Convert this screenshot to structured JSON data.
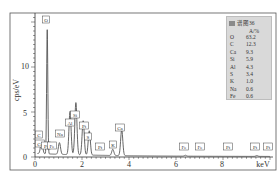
{
  "chart_data": {
    "type": "line",
    "title": "",
    "xlabel": "keV",
    "ylabel": "cps/eV",
    "xlim": [
      0,
      10
    ],
    "ylim": [
      0,
      14
    ],
    "x_ticks": [
      0,
      2,
      4,
      6,
      8
    ],
    "y_ticks": [
      0,
      5,
      10
    ],
    "grid": false,
    "legend_position": "upper right",
    "series": [
      {
        "name": "谱图36",
        "peaks": [
          {
            "element": "C",
            "energy_keV": 0.28,
            "cps_per_eV": 1.5
          },
          {
            "element": "O",
            "energy_keV": 0.52,
            "cps_per_eV": 13.8
          },
          {
            "element": "Na",
            "energy_keV": 1.04,
            "cps_per_eV": 1.3
          },
          {
            "element": "Al",
            "energy_keV": 1.49,
            "cps_per_eV": 4.8
          },
          {
            "element": "Si",
            "energy_keV": 1.74,
            "cps_per_eV": 5.8
          },
          {
            "element": "Pt",
            "energy_keV": 2.05,
            "cps_per_eV": 3.8
          },
          {
            "element": "S",
            "energy_keV": 2.31,
            "cps_per_eV": 2.7
          },
          {
            "element": "K",
            "energy_keV": 3.31,
            "cps_per_eV": 0.7
          },
          {
            "element": "Ca",
            "energy_keV": 3.69,
            "cps_per_eV": 2.9
          },
          {
            "element": "Fe",
            "energy_keV": 6.4,
            "cps_per_eV": 0.1
          },
          {
            "element": "Pt",
            "energy_keV": 9.44,
            "cps_per_eV": 0.1
          }
        ]
      }
    ],
    "peak_labels": [
      {
        "label": "O",
        "x_keV": 0.52
      },
      {
        "label": "C",
        "x_keV": 0.28
      },
      {
        "label": "Ca",
        "x_keV": 0.34
      },
      {
        "label": "Pt",
        "x_keV": 0.5
      },
      {
        "label": "Fe",
        "x_keV": 0.7
      },
      {
        "label": "Na",
        "x_keV": 1.04
      },
      {
        "label": "Al",
        "x_keV": 1.49
      },
      {
        "label": "Si",
        "x_keV": 1.74
      },
      {
        "label": "Pt",
        "x_keV": 2.05
      },
      {
        "label": "S",
        "x_keV": 2.31
      },
      {
        "label": "Pt",
        "x_keV": 2.7
      },
      {
        "label": "K",
        "x_keV": 3.31
      },
      {
        "label": "Ca",
        "x_keV": 3.69
      },
      {
        "label": "Fe",
        "x_keV": 6.4
      },
      {
        "label": "Fe",
        "x_keV": 7.06
      },
      {
        "label": "Pt",
        "x_keV": 8.27
      },
      {
        "label": "Pt",
        "x_keV": 9.44
      },
      {
        "label": "Pt",
        "x_keV": 9.7
      }
    ],
    "composition_table": {
      "title": "谱图36",
      "unit": "A/%",
      "rows": [
        {
          "element": "O",
          "value": 63.2
        },
        {
          "element": "C",
          "value": 12.3
        },
        {
          "element": "Ca",
          "value": 9.3
        },
        {
          "element": "Si",
          "value": 5.9
        },
        {
          "element": "Al",
          "value": 4.3
        },
        {
          "element": "S",
          "value": 3.4
        },
        {
          "element": "K",
          "value": 1.0
        },
        {
          "element": "Na",
          "value": 0.6
        },
        {
          "element": "Fe",
          "value": 0.6
        }
      ]
    }
  },
  "axes": {
    "xlabel": "keV",
    "ylabel": "cps/eV",
    "x_tick_labels": [
      "0",
      "2",
      "4",
      "6",
      "8"
    ],
    "y_tick_labels": [
      "0",
      "5",
      "10"
    ]
  },
  "legend": {
    "title": "谱图36",
    "unit": "A/%",
    "rows": [
      {
        "el": "O",
        "val": "63.2"
      },
      {
        "el": "C",
        "val": "12.3"
      },
      {
        "el": "Ca",
        "val": "9.3"
      },
      {
        "el": "Si",
        "val": "5.9"
      },
      {
        "el": "Al",
        "val": "4.3"
      },
      {
        "el": "S",
        "val": "3.4"
      },
      {
        "el": "K",
        "val": "1.0"
      },
      {
        "el": "Na",
        "val": "0.6"
      },
      {
        "el": "Fe",
        "val": "0.6"
      }
    ]
  },
  "colors": {
    "spectrum_line": "#555555",
    "frame": "#444444",
    "legend_bg": "#d9d9d9"
  }
}
